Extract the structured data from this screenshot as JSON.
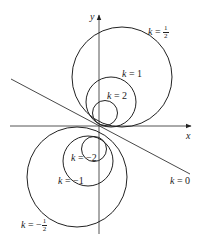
{
  "diagram": {
    "axes": {
      "x_label": "x",
      "y_label": "y"
    },
    "line": {
      "label_k": "k",
      "label_eq": " = ",
      "label_val": "0"
    },
    "curves": [
      {
        "k": "1/2",
        "num": "1",
        "den": "2",
        "sign": "",
        "cx": 122,
        "cy": 77,
        "r": 50
      },
      {
        "k": "1",
        "value": "1",
        "cx": 111,
        "cy": 102,
        "r": 25
      },
      {
        "k": "2",
        "value": "2",
        "cx": 105,
        "cy": 113,
        "r": 12
      },
      {
        "k": "-2",
        "value": "−2",
        "cx": 94,
        "cy": 149,
        "r": 12
      },
      {
        "k": "-1",
        "value": "−1",
        "cx": 88,
        "cy": 161,
        "r": 25
      },
      {
        "k": "-1/2",
        "num": "1",
        "den": "2",
        "sign": "−",
        "cx": 77,
        "cy": 177,
        "r": 50
      }
    ],
    "labels": {
      "k": "k",
      "eq": " = "
    },
    "colors": {
      "stroke": "#222222",
      "axis": "#555555"
    }
  }
}
